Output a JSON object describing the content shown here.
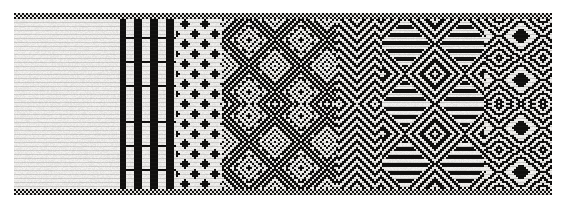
{
  "figure": {
    "title": "Woven textile band",
    "medium": "black and white weave, scanned",
    "canvas": {
      "width": 566,
      "height": 205,
      "background_color": "#ffffff"
    }
  },
  "textile": {
    "name": "woven-band",
    "bounds": {
      "x": 14,
      "y": 13,
      "width": 538,
      "height": 182
    },
    "colors": {
      "warp_dark": "#100f0e",
      "warp_light": "#f4f3f1",
      "ground": "#f2f1ef",
      "shadow": "#3a3836",
      "paper": "#ffffff"
    },
    "weave": {
      "cell_px": 2,
      "columns": 269,
      "rows": 91,
      "structure": "plain-weave / twill hybrid, warp-faced",
      "mirror_axis": "horizontal-center",
      "selvedge_top_rows": 3,
      "selvedge_bottom_rows": 3
    },
    "zones": [
      {
        "id": "zone-a",
        "label": "dense basket / herringbone field",
        "x_start": 0,
        "x_end": 0.195,
        "motif": "interlock",
        "scale": 3,
        "density": 0.52,
        "orientation": "mixed"
      },
      {
        "id": "zone-b",
        "label": "vertical stripe panel",
        "x_start": 0.195,
        "x_end": 0.3,
        "motif": "stripes",
        "scale": 4,
        "density": 0.5,
        "orientation": "vertical"
      },
      {
        "id": "zone-c",
        "label": "small lozenge lattice",
        "x_start": 0.3,
        "x_end": 0.385,
        "motif": "lattice",
        "scale": 5,
        "density": 0.5,
        "orientation": "mixed"
      },
      {
        "id": "zone-d",
        "label": "large concentric diamond medallions",
        "x_start": 0.385,
        "x_end": 0.6,
        "motif": "diamond",
        "scale": 13,
        "density": 0.5,
        "orientation": "diagonal"
      },
      {
        "id": "zone-e",
        "label": "chevron and zigzag column",
        "x_start": 0.6,
        "x_end": 0.685,
        "motif": "chevron",
        "scale": 9,
        "density": 0.51,
        "orientation": "diagonal"
      },
      {
        "id": "zone-f",
        "label": "banded diamond medallions",
        "x_start": 0.685,
        "x_end": 0.875,
        "motif": "banded-diamond",
        "scale": 15,
        "density": 0.47,
        "orientation": "horizontal"
      },
      {
        "id": "zone-g",
        "label": "eye-of-diamond terminal panel",
        "x_start": 0.875,
        "x_end": 1.0,
        "motif": "eye-diamond",
        "scale": 11,
        "density": 0.49,
        "orientation": "horizontal"
      }
    ]
  }
}
